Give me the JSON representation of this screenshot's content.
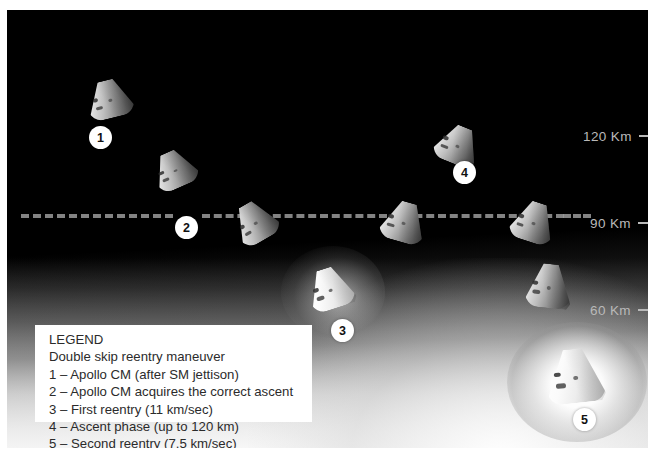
{
  "panel": {
    "background_color": "#000000",
    "altitude_markers": [
      {
        "label": "120 Km",
        "y": 127
      },
      {
        "label": "90 Km",
        "y": 214
      },
      {
        "label": "60 Km",
        "y": 301
      }
    ],
    "trajectory_line": {
      "altitude": "90 Km",
      "style": "dashed",
      "color": "#9a9a9a"
    }
  },
  "capsules": [
    {
      "name": "apollo-cm-1",
      "badge": "1",
      "phase": "Apollo CM (after SM jettison)"
    },
    {
      "name": "apollo-cm-descending",
      "badge": "",
      "phase": "descending"
    },
    {
      "name": "apollo-cm-2",
      "badge": "2",
      "phase": "Apollo CM acquires the correct ascent"
    },
    {
      "name": "apollo-cm-first-reentry",
      "badge": "3",
      "phase": "First reentry (11 km/sec)"
    },
    {
      "name": "apollo-cm-skipping",
      "badge": "",
      "phase": "skip out"
    },
    {
      "name": "apollo-cm-ascent",
      "badge": "4",
      "phase": "Ascent phase (up to 120 km)"
    },
    {
      "name": "apollo-cm-descending-2",
      "badge": "",
      "phase": "descending again"
    },
    {
      "name": "apollo-cm-second-reentry",
      "badge": "5",
      "phase": "Second reentry (7.5 km/sec)"
    }
  ],
  "legend": {
    "title": "LEGEND",
    "subtitle": "Double skip reentry maneuver",
    "items": [
      "1 – Apollo CM (after SM jettison)",
      "2 – Apollo CM acquires the correct ascent",
      "3 – First reentry (11 km/sec)",
      "4 – Ascent phase (up to 120 km)",
      "5 – Second reentry (7.5 km/sec)"
    ]
  },
  "badges": {
    "one": "1",
    "two": "2",
    "three": "3",
    "four": "4",
    "five": "5"
  }
}
